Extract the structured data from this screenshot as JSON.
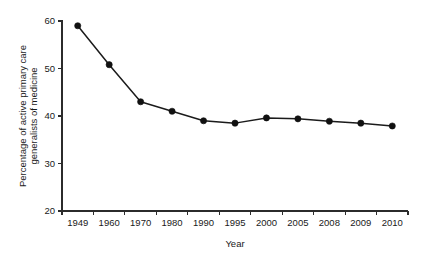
{
  "chart_data": {
    "type": "line",
    "title": "",
    "xlabel": "Year",
    "ylabel_line1": "Percentage of active primary care",
    "ylabel_line2": "generalists of medicine",
    "categories": [
      "1949",
      "1960",
      "1970",
      "1980",
      "1990",
      "1995",
      "2000",
      "2005",
      "2008",
      "2009",
      "2010"
    ],
    "values": [
      59.0,
      50.8,
      43.0,
      41.0,
      39.0,
      38.5,
      39.6,
      39.4,
      38.9,
      38.5,
      37.9
    ],
    "series": [
      {
        "name": "Percentage of active primary care generalists of medicine",
        "values": [
          59.0,
          50.8,
          43.0,
          41.0,
          39.0,
          38.5,
          39.6,
          39.4,
          38.9,
          38.5,
          37.9
        ]
      }
    ],
    "ylim": [
      20,
      60
    ],
    "yticks": [
      20,
      30,
      40,
      50,
      60
    ],
    "ytick_labels": [
      "20",
      "30",
      "40",
      "50",
      "60"
    ],
    "grid": false,
    "legend": false,
    "marker": "filled-circle",
    "line_color": "#1b1b1b",
    "marker_color": "#111111",
    "background_color": "#ffffff"
  }
}
